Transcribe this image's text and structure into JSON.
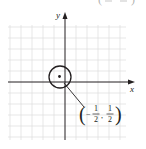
{
  "figure": {
    "type": "coordinate-plane-diagram",
    "axes": {
      "x_label": "x",
      "y_label": "y"
    },
    "grid": {
      "visible": true,
      "color": "#d9d9d9"
    },
    "circle": {
      "center_label": "(-1/2, 1/2)",
      "center": {
        "x": -0.5,
        "y": 0.5
      },
      "stroke": "#231f20"
    },
    "annotation": {
      "open_paren": "(",
      "minus": "−",
      "x_num": "1",
      "x_den": "2",
      "comma": ",",
      "y_num": "1",
      "y_den": "2",
      "close_paren": ")"
    },
    "top_cut_text": {
      "open_paren": "(",
      "close_paren": ")"
    },
    "colors": {
      "ink": "#231f20",
      "grid": "#d9d9d9",
      "background": "#ffffff"
    }
  }
}
